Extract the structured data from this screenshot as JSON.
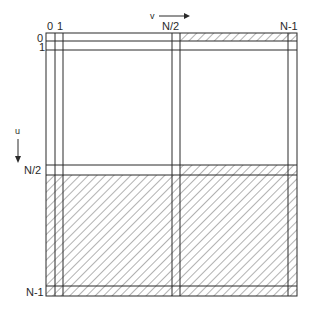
{
  "diagram": {
    "axis_u": {
      "label": "u",
      "direction": "down"
    },
    "axis_v": {
      "label": "v",
      "direction": "right"
    },
    "column_labels": [
      "0",
      "1",
      "N/2",
      "N-1"
    ],
    "row_labels": [
      "0",
      "1",
      "N/2",
      "N-1"
    ],
    "colors": {
      "line": "#2a2a2a",
      "hatch": "#555555",
      "background": "#ffffff"
    },
    "regions": {
      "hatched": [
        "top row (index 0) for columns N/2..N-1",
        "row N/2 for columns N/2..N-1",
        "all rows N/2+1..N-1 (bottom half)"
      ],
      "unhatched": [
        "top-left quadrant",
        "top-right quadrant interior"
      ]
    }
  }
}
